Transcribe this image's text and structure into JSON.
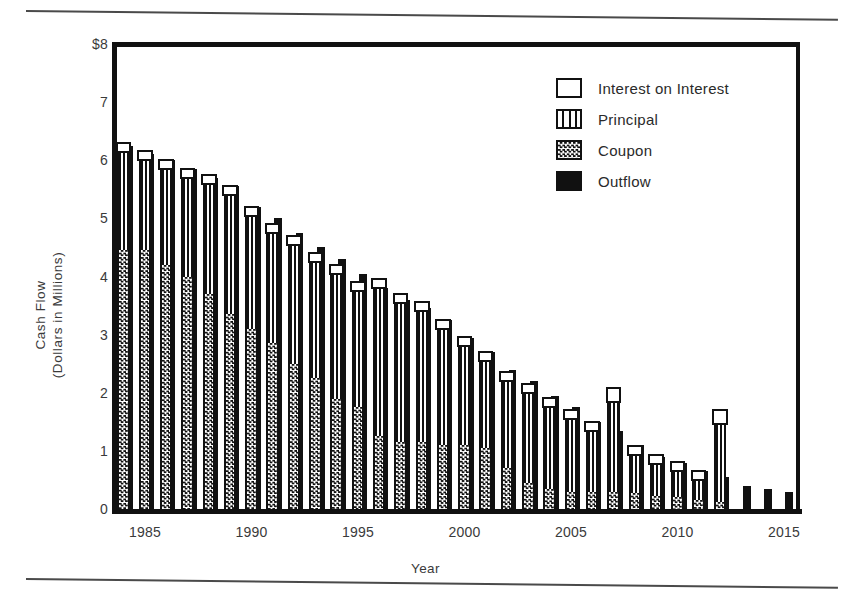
{
  "figure": {
    "y_axis_title_line1": "Cash Flow",
    "y_axis_title_line2": "(Dollars in Millions)",
    "x_axis_title": "Year"
  },
  "legend": {
    "position": "top-right",
    "items": [
      {
        "label": "Interest on Interest",
        "swatch": "white-box",
        "icon": "legend-swatch-interest"
      },
      {
        "label": "Principal",
        "swatch": "vertical-stripes",
        "icon": "legend-swatch-principal"
      },
      {
        "label": "Coupon",
        "swatch": "checkerboard",
        "icon": "legend-swatch-coupon"
      },
      {
        "label": "Outflow",
        "swatch": "solid-black",
        "icon": "legend-swatch-outflow"
      }
    ]
  },
  "chart_data": {
    "type": "bar",
    "title": "",
    "subtitle": "",
    "xlabel": "Year",
    "ylabel": "Cash Flow (Dollars in Millions)",
    "stacked": true,
    "grid": false,
    "ylim": [
      0,
      8
    ],
    "ytick_labels": [
      "0",
      "1",
      "2",
      "3",
      "4",
      "5",
      "6",
      "7",
      "$8"
    ],
    "ytick_values": [
      0,
      1,
      2,
      3,
      4,
      5,
      6,
      7,
      8
    ],
    "xtick_labels": [
      "1985",
      "1990",
      "1995",
      "2000",
      "2005",
      "2010",
      "2015"
    ],
    "xtick_values": [
      1985,
      1990,
      1995,
      2000,
      2005,
      2010,
      2015
    ],
    "xlim": [
      1983.4,
      2015.6
    ],
    "categories": [
      1984,
      1985,
      1986,
      1987,
      1988,
      1989,
      1990,
      1991,
      1992,
      1993,
      1994,
      1995,
      1996,
      1997,
      1998,
      1999,
      2000,
      2001,
      2002,
      2003,
      2004,
      2005,
      2006,
      2007,
      2008,
      2009,
      2010,
      2011,
      2012,
      2013,
      2014,
      2015
    ],
    "series": [
      {
        "name": "Coupon",
        "pattern": "checkerboard",
        "values": [
          4.45,
          4.45,
          4.2,
          4.0,
          3.7,
          3.35,
          3.1,
          2.85,
          2.5,
          2.25,
          1.9,
          1.75,
          1.25,
          1.15,
          1.15,
          1.1,
          1.1,
          1.05,
          0.7,
          0.45,
          0.35,
          0.3,
          0.3,
          0.3,
          0.28,
          0.22,
          0.2,
          0.15,
          0.12,
          0.0,
          0.0,
          0.0
        ]
      },
      {
        "name": "Interest on Interest",
        "pattern": "vertical-stripes",
        "values": [
          1.75,
          1.6,
          1.7,
          1.75,
          1.95,
          2.1,
          2.0,
          1.95,
          2.1,
          2.05,
          2.2,
          2.05,
          2.6,
          2.45,
          2.3,
          2.05,
          1.75,
          1.55,
          1.55,
          1.6,
          1.45,
          1.3,
          1.1,
          1.6,
          0.7,
          0.6,
          0.5,
          0.4,
          1.4,
          0.0,
          0.0,
          0.0
        ]
      },
      {
        "name": "Principal",
        "pattern": "white-box",
        "values": [
          0.12,
          0.12,
          0.12,
          0.12,
          0.12,
          0.12,
          0.12,
          0.12,
          0.12,
          0.12,
          0.12,
          0.12,
          0.12,
          0.12,
          0.12,
          0.12,
          0.12,
          0.12,
          0.12,
          0.12,
          0.12,
          0.12,
          0.12,
          0.2,
          0.12,
          0.12,
          0.12,
          0.12,
          0.2,
          0.0,
          0.0,
          0.0
        ]
      },
      {
        "name": "Outflow",
        "pattern": "solid-black",
        "values": [
          6.25,
          6.1,
          6.0,
          5.85,
          5.7,
          5.55,
          5.2,
          5.0,
          4.75,
          4.5,
          4.3,
          4.05,
          3.8,
          3.6,
          3.45,
          3.25,
          2.95,
          2.7,
          2.4,
          2.2,
          1.95,
          1.75,
          1.5,
          1.35,
          1.1,
          0.9,
          0.8,
          0.65,
          0.55,
          0.4,
          0.35,
          0.3
        ]
      }
    ],
    "totals": [
      6.32,
      6.17,
      6.02,
      5.87,
      5.77,
      5.57,
      5.22,
      4.92,
      4.72,
      4.42,
      4.22,
      3.92,
      3.97,
      3.72,
      3.57,
      3.27,
      2.97,
      2.72,
      2.37,
      2.17,
      1.92,
      1.72,
      1.52,
      2.1,
      1.1,
      0.94,
      0.82,
      0.67,
      1.72,
      0.0,
      0.0,
      0.0
    ]
  }
}
